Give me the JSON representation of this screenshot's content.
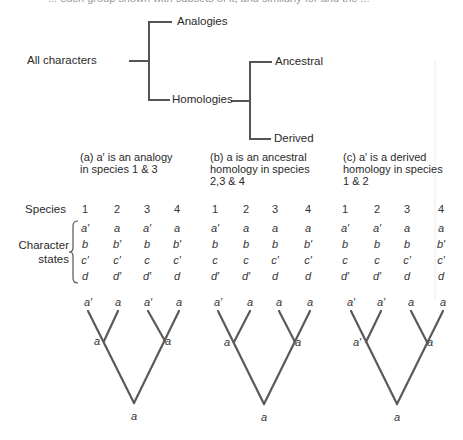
{
  "clipped_header": "... each group shown with subsets of it, and similarly for and the ...",
  "hierarchy": {
    "root": "All characters",
    "level1": [
      "Analogies",
      "Homologies"
    ],
    "level2": [
      "Ancestral",
      "Derived"
    ]
  },
  "row_labels": {
    "species": "Species",
    "character_states_line1": "Character",
    "character_states_line2": "states"
  },
  "panels": [
    {
      "id": "a",
      "caption_lines": [
        "(a)  a′ is an analogy",
        "in species 1 & 3"
      ],
      "species": [
        "1",
        "2",
        "3",
        "4"
      ],
      "states": [
        [
          "a′",
          "a",
          "a′",
          "a"
        ],
        [
          "b",
          "b′",
          "b",
          "b′"
        ],
        [
          "c′",
          "c′",
          "c",
          "c′"
        ],
        [
          "d",
          "d′",
          "d′",
          "d"
        ]
      ],
      "tree": {
        "tips": [
          "a′",
          "a",
          "a′",
          "a"
        ],
        "inner_left": "a",
        "inner_right": "a",
        "root": "a"
      }
    },
    {
      "id": "b",
      "caption_lines": [
        "(b)  a is an ancestral",
        "homology in species",
        "2,3 & 4"
      ],
      "species": [
        "1",
        "2",
        "3",
        "4"
      ],
      "states": [
        [
          "a′",
          "a",
          "a",
          "a"
        ],
        [
          "b",
          "b",
          "b",
          "b′"
        ],
        [
          "c",
          "c",
          "c′",
          "c′"
        ],
        [
          "d′",
          "d′",
          "d",
          "d"
        ]
      ],
      "tree": {
        "tips": [
          "a′",
          "a",
          "a",
          "a"
        ],
        "inner_left": "a",
        "inner_right": "a",
        "root": "a"
      }
    },
    {
      "id": "c",
      "caption_lines": [
        "(c)  a′ is a derived",
        "homology in species",
        "1 & 2"
      ],
      "species": [
        "1",
        "2",
        "3",
        "4"
      ],
      "states": [
        [
          "a′",
          "a′",
          "a",
          "a"
        ],
        [
          "b",
          "b",
          "b",
          "b′"
        ],
        [
          "c",
          "c",
          "c′",
          "c′"
        ],
        [
          "d′",
          "d′",
          "d",
          "d"
        ]
      ],
      "tree": {
        "tips": [
          "a′",
          "a′",
          "a",
          "a"
        ],
        "inner_left": "a′",
        "inner_right": "a",
        "root": "a"
      }
    }
  ],
  "colors": {
    "line": "#555555",
    "text": "#2a2a2a",
    "faint_rule": "#e6e6e6"
  }
}
